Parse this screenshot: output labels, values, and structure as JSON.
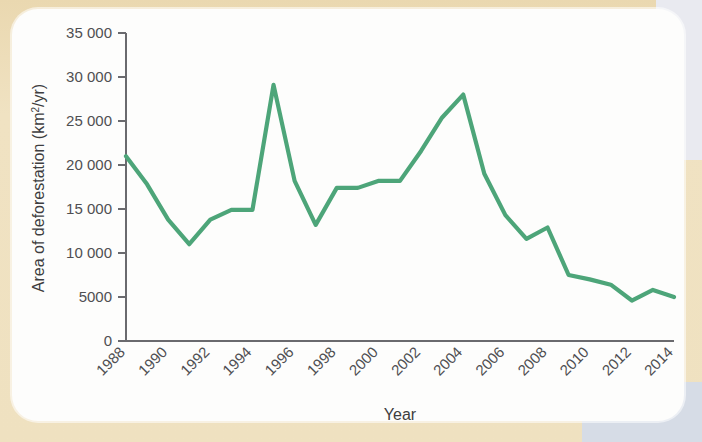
{
  "figure": {
    "background_color": "#efe1c0",
    "card_color": "#fdfdfc"
  },
  "chart_data": {
    "type": "line",
    "title": "",
    "xlabel": "Year",
    "ylabel": "Area of deforestation (km2/yr)",
    "ylabel_prefix": "Area of deforestation (km",
    "ylabel_sup": "2",
    "ylabel_suffix": "/yr)",
    "series_color": "#4da579",
    "grid": false,
    "legend": false,
    "xlim": [
      1988,
      2014
    ],
    "ylim": [
      0,
      35000
    ],
    "ytick_values": [
      0,
      5000,
      10000,
      15000,
      20000,
      25000,
      30000,
      35000
    ],
    "ytick_labels": [
      "0",
      "5000",
      "10 000",
      "15 000",
      "20 000",
      "25 000",
      "30 000",
      "35 000"
    ],
    "xtick_values": [
      1988,
      1990,
      1992,
      1994,
      1996,
      1998,
      2000,
      2002,
      2004,
      2006,
      2008,
      2010,
      2012,
      2014
    ],
    "xtick_labels": [
      "1988",
      "1990",
      "1992",
      "1994",
      "1996",
      "1998",
      "2000",
      "2002",
      "2004",
      "2006",
      "2008",
      "2010",
      "2012",
      "2014"
    ],
    "xtick_rotation_deg": 45,
    "x": [
      1988,
      1989,
      1990,
      1991,
      1992,
      1993,
      1994,
      1995,
      1996,
      1997,
      1998,
      1999,
      2000,
      2001,
      2002,
      2003,
      2004,
      2005,
      2006,
      2007,
      2008,
      2009,
      2010,
      2011,
      2012,
      2013,
      2014
    ],
    "values": [
      21000,
      17800,
      13800,
      11000,
      13800,
      14900,
      14900,
      29100,
      18200,
      13200,
      17400,
      17400,
      18200,
      18200,
      21600,
      25400,
      28000,
      19000,
      14300,
      11600,
      12900,
      7500,
      7000,
      6400,
      4600,
      5800,
      5000
    ],
    "series": [
      {
        "name": "Area of deforestation",
        "color": "#4da579",
        "values": [
          21000,
          17800,
          13800,
          11000,
          13800,
          14900,
          14900,
          29100,
          18200,
          13200,
          17400,
          17400,
          18200,
          18200,
          21600,
          25400,
          28000,
          19000,
          14300,
          11600,
          12900,
          7500,
          7000,
          6400,
          4600,
          5800,
          5000
        ]
      }
    ]
  }
}
